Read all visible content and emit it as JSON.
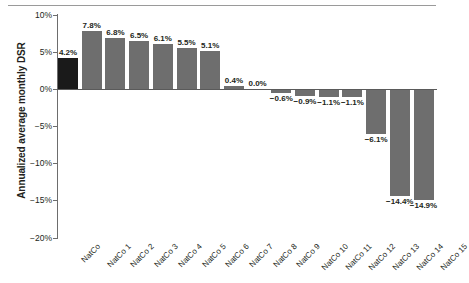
{
  "chart_data": {
    "type": "bar",
    "title": "",
    "subtitle": "",
    "xlabel": "",
    "ylabel": "Annualized average monthly DSR",
    "ylim": [
      -20,
      10
    ],
    "ytick_values": [
      10,
      5,
      0,
      -5,
      -10,
      -15,
      -20
    ],
    "ytick_labels": [
      "10%",
      "5%",
      "0%",
      "−5%",
      "−10%",
      "−15%",
      "−20%"
    ],
    "grid": false,
    "legend": null,
    "categories": [
      "NatCo",
      "NatCo 1",
      "NatCo 2",
      "NatCo 3",
      "NatCo 4",
      "NatCo 5",
      "NatCo 6",
      "NatCo 7",
      "NatCo 8",
      "NatCo 9",
      "NatCo 10",
      "NatCo 11",
      "NatCo 12",
      "NatCo 13",
      "NatCo 14",
      "NatCo 15"
    ],
    "values": [
      4.2,
      7.8,
      6.8,
      6.5,
      6.1,
      5.5,
      5.1,
      0.4,
      0.0,
      -0.6,
      -0.9,
      -1.1,
      -1.1,
      -6.1,
      -14.4,
      -14.9
    ],
    "data_labels": [
      "4.2%",
      "7.8%",
      "6.8%",
      "6.5%",
      "6.1%",
      "5.5%",
      "5.1%",
      "0.4%",
      "0.0%",
      "−0.6%",
      "−0.9%",
      "−1.1%",
      "−1.1%",
      "−6.1%",
      "−14.4%",
      "−14.9%"
    ],
    "highlight_index": 0,
    "colors": {
      "bar": "#6e6e6e",
      "bar_highlight": "#1a1a1a",
      "axis": "#6d6d6d",
      "text": "#231f20",
      "background": "#ffffff",
      "top_rule": "#9a9a9a"
    }
  }
}
